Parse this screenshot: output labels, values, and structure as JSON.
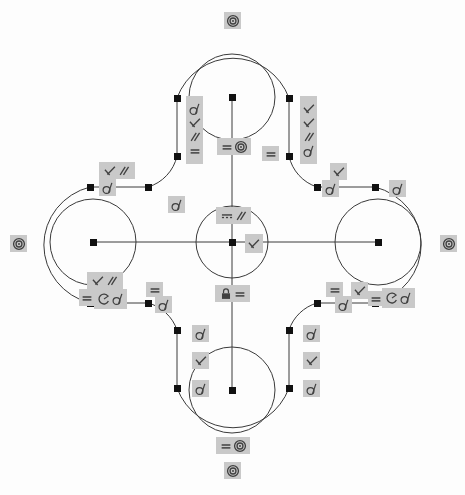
{
  "app": {
    "title": "Sketch Constraint View",
    "background_color": "#fdfdfd",
    "geometry_color": "#3a3a3a",
    "point_color": "#111111",
    "badge_color": "#c9c9c9",
    "icon_color": "#404040"
  },
  "icons": {
    "tangent": "tangent-icon",
    "perpendicular": "perpendicular-icon",
    "parallel": "parallel-icon",
    "equal": "equal-icon",
    "concentric": "concentric-icon",
    "horizontal": "horizontal-icon",
    "block": "block-lock-icon",
    "radius": "radius-arc-icon"
  },
  "geometry": {
    "center": {
      "x": 232,
      "y": 242
    },
    "center_circle_radius": 36,
    "lobe_inner_radius": 43,
    "lobe_outer_radius": 78,
    "lobes": [
      {
        "name": "top-lobe",
        "cx": 232,
        "cy": 97
      },
      {
        "name": "bottom-lobe",
        "cx": 232,
        "cy": 390
      },
      {
        "name": "left-lobe",
        "cx": 93,
        "cy": 242
      },
      {
        "name": "right-lobe",
        "cx": 378,
        "cy": 242
      }
    ],
    "points": [
      {
        "name": "center-point",
        "x": 232,
        "y": 242
      },
      {
        "name": "top-lobe-center",
        "x": 232,
        "y": 97
      },
      {
        "name": "bottom-lobe-center",
        "x": 232,
        "y": 390
      },
      {
        "name": "left-lobe-center",
        "x": 93,
        "y": 242
      },
      {
        "name": "right-lobe-center",
        "x": 378,
        "y": 242
      },
      {
        "name": "node-top-left-upper",
        "x": 177,
        "y": 98
      },
      {
        "name": "node-top-left-lower",
        "x": 177,
        "y": 156
      },
      {
        "name": "node-top-right-upper",
        "x": 289,
        "y": 98
      },
      {
        "name": "node-top-right-lower",
        "x": 289,
        "y": 156
      },
      {
        "name": "node-left-upper-outer",
        "x": 90,
        "y": 187
      },
      {
        "name": "node-left-upper-inner",
        "x": 148,
        "y": 187
      },
      {
        "name": "node-right-upper-inner",
        "x": 317,
        "y": 187
      },
      {
        "name": "node-right-upper-outer",
        "x": 375,
        "y": 187
      },
      {
        "name": "node-left-lower-outer",
        "x": 90,
        "y": 303
      },
      {
        "name": "node-left-lower-inner",
        "x": 148,
        "y": 303
      },
      {
        "name": "node-right-lower-inner",
        "x": 317,
        "y": 303
      },
      {
        "name": "node-right-lower-outer",
        "x": 375,
        "y": 303
      },
      {
        "name": "node-bottom-left-upper",
        "x": 177,
        "y": 330
      },
      {
        "name": "node-bottom-left-lower",
        "x": 177,
        "y": 388
      },
      {
        "name": "node-bottom-right-upper",
        "x": 289,
        "y": 330
      },
      {
        "name": "node-bottom-right-lower",
        "x": 289,
        "y": 388
      }
    ]
  },
  "constraints": [
    {
      "name": "top-outer-concentric",
      "icons": [
        "concentric"
      ],
      "x": 224,
      "y": 12,
      "w": 17,
      "h": 17,
      "dir": "row"
    },
    {
      "name": "top-left-stack",
      "icons": [
        "tangent",
        "perpendicular",
        "parallel",
        "equal"
      ],
      "x": 186,
      "y": 96,
      "w": 17,
      "h": 68,
      "dir": "col"
    },
    {
      "name": "top-right-stack",
      "icons": [
        "perpendicular",
        "perpendicular",
        "parallel",
        "tangent"
      ],
      "x": 300,
      "y": 96,
      "w": 17,
      "h": 68,
      "dir": "col"
    },
    {
      "name": "top-center-equal-concentric",
      "icons": [
        "equal",
        "concentric"
      ],
      "x": 217,
      "y": 138,
      "w": 34,
      "h": 17,
      "dir": "row"
    },
    {
      "name": "top-right-equal",
      "icons": [
        "equal"
      ],
      "x": 262,
      "y": 146,
      "w": 17,
      "h": 15,
      "dir": "row"
    },
    {
      "name": "upper-left-perp-parallel",
      "icons": [
        "perpendicular",
        "parallel"
      ],
      "x": 99,
      "y": 162,
      "w": 36,
      "h": 17,
      "dir": "row"
    },
    {
      "name": "upper-left-tangent",
      "icons": [
        "tangent"
      ],
      "x": 99,
      "y": 179,
      "w": 17,
      "h": 17,
      "dir": "row"
    },
    {
      "name": "upper-mid-tangent",
      "icons": [
        "tangent"
      ],
      "x": 168,
      "y": 196,
      "w": 17,
      "h": 17,
      "dir": "row"
    },
    {
      "name": "upper-right-perpendicular",
      "icons": [
        "perpendicular"
      ],
      "x": 330,
      "y": 163,
      "w": 17,
      "h": 17,
      "dir": "row"
    },
    {
      "name": "upper-right-tangent-a",
      "icons": [
        "tangent"
      ],
      "x": 322,
      "y": 180,
      "w": 17,
      "h": 17,
      "dir": "row"
    },
    {
      "name": "upper-right-tangent-b",
      "icons": [
        "tangent"
      ],
      "x": 389,
      "y": 180,
      "w": 17,
      "h": 17,
      "dir": "row"
    },
    {
      "name": "center-horizontal-parallel",
      "icons": [
        "horizontal",
        "parallel"
      ],
      "x": 216,
      "y": 207,
      "w": 35,
      "h": 17,
      "dir": "row"
    },
    {
      "name": "center-perpendicular",
      "icons": [
        "perpendicular"
      ],
      "x": 245,
      "y": 234,
      "w": 18,
      "h": 19,
      "dir": "row"
    },
    {
      "name": "center-block-equal",
      "icons": [
        "block",
        "equal"
      ],
      "x": 215,
      "y": 285,
      "w": 35,
      "h": 17,
      "dir": "row"
    },
    {
      "name": "lower-left-perp-parallel",
      "icons": [
        "perpendicular",
        "parallel"
      ],
      "x": 87,
      "y": 272,
      "w": 36,
      "h": 17,
      "dir": "row"
    },
    {
      "name": "lower-left-equal",
      "icons": [
        "equal"
      ],
      "x": 79,
      "y": 289,
      "w": 15,
      "h": 17,
      "dir": "row"
    },
    {
      "name": "lower-left-radius-tangent",
      "icons": [
        "radius",
        "tangent"
      ],
      "x": 94,
      "y": 289,
      "w": 33,
      "h": 20,
      "dir": "row"
    },
    {
      "name": "lower-mid-equal",
      "icons": [
        "equal"
      ],
      "x": 146,
      "y": 282,
      "w": 17,
      "h": 15,
      "dir": "row"
    },
    {
      "name": "lower-mid-tangent",
      "icons": [
        "tangent"
      ],
      "x": 155,
      "y": 296,
      "w": 17,
      "h": 17,
      "dir": "row"
    },
    {
      "name": "lower-right-equal-a",
      "icons": [
        "equal"
      ],
      "x": 326,
      "y": 282,
      "w": 17,
      "h": 15,
      "dir": "row"
    },
    {
      "name": "lower-right-perpendicular",
      "icons": [
        "perpendicular"
      ],
      "x": 351,
      "y": 282,
      "w": 17,
      "h": 17,
      "dir": "row"
    },
    {
      "name": "lower-right-tangent-a",
      "icons": [
        "tangent"
      ],
      "x": 335,
      "y": 296,
      "w": 17,
      "h": 17,
      "dir": "row"
    },
    {
      "name": "lower-right-equal-b",
      "icons": [
        "equal"
      ],
      "x": 368,
      "y": 291,
      "w": 15,
      "h": 15,
      "dir": "row"
    },
    {
      "name": "lower-right-radius-tangent",
      "icons": [
        "radius",
        "tangent"
      ],
      "x": 382,
      "y": 288,
      "w": 33,
      "h": 20,
      "dir": "row"
    },
    {
      "name": "bottom-left-tangent-a",
      "icons": [
        "tangent"
      ],
      "x": 192,
      "y": 325,
      "w": 17,
      "h": 17,
      "dir": "row"
    },
    {
      "name": "bottom-left-perpendicular",
      "icons": [
        "perpendicular"
      ],
      "x": 192,
      "y": 352,
      "w": 17,
      "h": 17,
      "dir": "row"
    },
    {
      "name": "bottom-left-tangent-b",
      "icons": [
        "tangent"
      ],
      "x": 192,
      "y": 380,
      "w": 17,
      "h": 17,
      "dir": "row"
    },
    {
      "name": "bottom-right-tangent-a",
      "icons": [
        "tangent"
      ],
      "x": 303,
      "y": 325,
      "w": 17,
      "h": 17,
      "dir": "row"
    },
    {
      "name": "bottom-right-perpendicular",
      "icons": [
        "perpendicular"
      ],
      "x": 303,
      "y": 352,
      "w": 17,
      "h": 17,
      "dir": "row"
    },
    {
      "name": "bottom-right-tangent-b",
      "icons": [
        "tangent"
      ],
      "x": 303,
      "y": 380,
      "w": 17,
      "h": 17,
      "dir": "row"
    },
    {
      "name": "bottom-center-equal-concentric",
      "icons": [
        "equal",
        "concentric"
      ],
      "x": 216,
      "y": 437,
      "w": 34,
      "h": 17,
      "dir": "row"
    },
    {
      "name": "bottom-outer-concentric",
      "icons": [
        "concentric"
      ],
      "x": 224,
      "y": 462,
      "w": 17,
      "h": 17,
      "dir": "row"
    },
    {
      "name": "left-outer-concentric",
      "icons": [
        "concentric"
      ],
      "x": 10,
      "y": 235,
      "w": 17,
      "h": 17,
      "dir": "row"
    },
    {
      "name": "right-outer-concentric",
      "icons": [
        "concentric"
      ],
      "x": 440,
      "y": 235,
      "w": 17,
      "h": 17,
      "dir": "row"
    }
  ]
}
